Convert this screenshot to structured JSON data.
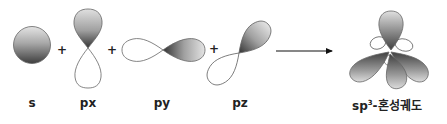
{
  "diagram": {
    "operators": [
      "+",
      "+",
      "+"
    ],
    "labels": {
      "s": "s",
      "px": "px",
      "py": "py",
      "pz": "pz",
      "result_prefix": "sp",
      "result_sup": "3",
      "result_suffix": "-혼성궤도"
    },
    "colors": {
      "shade_dark": "#3a3a3a",
      "shade_light": "#e6e6e6",
      "outline": "#666666",
      "text": "#222222"
    }
  }
}
